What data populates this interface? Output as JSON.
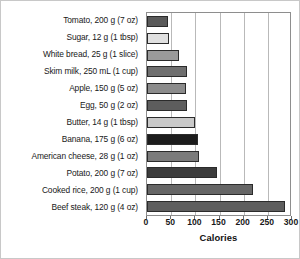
{
  "chart_data": {
    "type": "bar",
    "orientation": "horizontal",
    "title": "",
    "xlabel": "Calories",
    "ylabel": "",
    "xlim": [
      0,
      300
    ],
    "ylim": null,
    "grid": true,
    "legend": null,
    "xticks": [
      0,
      50,
      100,
      150,
      200,
      250,
      300
    ],
    "xtick_labels": [
      "0",
      "50",
      "100",
      "150",
      "200",
      "250",
      "300"
    ],
    "categories": [
      "Tomato, 200 g (7 oz)",
      "Sugar, 12 g (1 tbsp)",
      "White bread, 25 g (1 slice)",
      "Skim milk, 250 mL (1 cup)",
      "Apple, 150 g (5 oz)",
      "Egg, 50 g (2 oz)",
      "Butter, 14 g (1 tbsp)",
      "Banana, 175 g (6 oz)",
      "American cheese, 28 g (1 oz)",
      "Potato, 200 g (7 oz)",
      "Cooked rice, 200 g (1 cup)",
      "Beef steak, 120 g (4 oz)"
    ],
    "values": [
      44,
      46,
      67,
      83,
      80,
      82,
      100,
      105,
      107,
      145,
      220,
      285
    ],
    "bar_colors": [
      "#5a5a5a",
      "#e0e0e0",
      "#9a9a9a",
      "#6f6f6f",
      "#8c8c8c",
      "#5d5d5d",
      "#c9c9c9",
      "#1c1c1c",
      "#7b7b7b",
      "#3c3c3c",
      "#666666",
      "#5e5e5e"
    ]
  },
  "axis": {
    "grid_color": "#b9b9b9",
    "frame_color": "#8e8e8e",
    "bar_edge_color": "#2b2b2b"
  }
}
